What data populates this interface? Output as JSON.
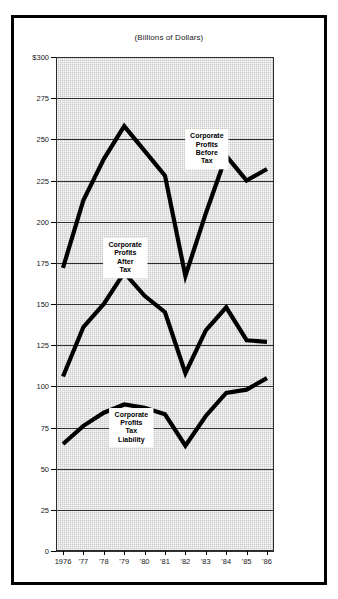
{
  "chart_data": {
    "type": "line",
    "title": "(Billions of Dollars)",
    "xlabel": "",
    "ylabel": "",
    "ylim": [
      0,
      300
    ],
    "yticks": [
      0,
      25,
      50,
      75,
      100,
      125,
      150,
      175,
      200,
      225,
      250,
      275,
      300
    ],
    "ytick_labels": [
      "0",
      "25",
      "50",
      "75",
      "100",
      "125",
      "150",
      "175",
      "200",
      "225",
      "250",
      "275",
      "$300"
    ],
    "grid": true,
    "legend_position": "inline-annotations",
    "x": [
      1976,
      1977,
      1978,
      1979,
      1980,
      1981,
      1982,
      1983,
      1984,
      1985,
      1986
    ],
    "categories": [
      "1976",
      "'77",
      "'78",
      "'79",
      "'80",
      "'81",
      "'82",
      "'83",
      "'84",
      "'85",
      "'86"
    ],
    "series": [
      {
        "name": "Corporate Profits Before Tax",
        "label": "Corporate\nProfits\nBefore\nTax",
        "values": [
          172,
          213,
          238,
          258,
          243,
          228,
          167,
          205,
          240,
          225,
          232
        ]
      },
      {
        "name": "Corporate Profits After Tax",
        "label": "Corporate\nProfits\nAfter\nTax",
        "values": [
          106,
          136,
          150,
          169,
          155,
          145,
          108,
          134,
          148,
          128,
          127
        ]
      },
      {
        "name": "Corporate Profits Tax Liability",
        "label": "Corporate\nProfits\nTax\nLiability",
        "values": [
          65,
          76,
          84,
          89,
          87,
          83,
          64,
          82,
          96,
          98,
          105
        ]
      }
    ],
    "annotations": [
      {
        "text": "Corporate\nProfits\nBefore\nTax",
        "series": "Corporate Profits Before Tax",
        "x": 1983.05,
        "y": 244
      },
      {
        "text": "Corporate\nProfits\nAfter\nTax",
        "series": "Corporate Profits After Tax",
        "x": 1979.05,
        "y": 178
      },
      {
        "text": "Corporate\nProfits\nTax\nLiability",
        "series": "Corporate Profits Tax Liability",
        "x": 1979.35,
        "y": 75
      }
    ],
    "colors": {
      "line": "#000000",
      "plot_background": "#c9c9c9",
      "grid": "#2f2f2f",
      "frame": "#000000",
      "page_background": "#ffffff",
      "text": "#1a1a1a"
    }
  }
}
